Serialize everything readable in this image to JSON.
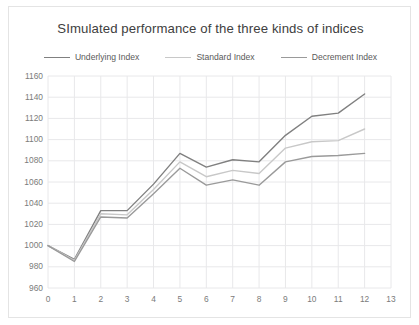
{
  "chart": {
    "title": "SImulated performance of the three kinds of indices",
    "frame_color": "#e4e4e4",
    "background": "#ffffff",
    "grid_color": "#e8e8ea",
    "axis_text_color": "#7b7b7b",
    "title_color": "#404040"
  },
  "legend": {
    "position": "top-center",
    "entries": [
      {
        "label": "Underlying Index",
        "color": "#808080"
      },
      {
        "label": "Standard Index",
        "color": "#c8c8c8"
      },
      {
        "label": "Decrement Index",
        "color": "#9a9a9a"
      }
    ]
  },
  "chart_data": {
    "type": "line",
    "title": "SImulated performance of the three kinds of indices",
    "xlabel": "",
    "ylabel": "",
    "xlim": [
      0,
      13
    ],
    "ylim": [
      960,
      1160
    ],
    "xticks": [
      0,
      1,
      2,
      3,
      4,
      5,
      6,
      7,
      8,
      9,
      10,
      11,
      12,
      13
    ],
    "yticks": [
      960,
      980,
      1000,
      1020,
      1040,
      1060,
      1080,
      1100,
      1120,
      1140,
      1160
    ],
    "grid": true,
    "x": [
      0,
      1,
      2,
      3,
      4,
      5,
      6,
      7,
      8,
      9,
      10,
      11,
      12
    ],
    "series": [
      {
        "name": "Underlying Index",
        "color": "#808080",
        "values": [
          1000,
          987,
          1033,
          1033,
          1058,
          1087,
          1074,
          1081,
          1079,
          1104,
          1122,
          1125,
          1143
        ]
      },
      {
        "name": "Standard Index",
        "color": "#c8c8c8",
        "values": [
          1000,
          986,
          1030,
          1029,
          1053,
          1079,
          1065,
          1071,
          1068,
          1092,
          1098,
          1099,
          1110
        ]
      },
      {
        "name": "Decrement Index",
        "color": "#9a9a9a",
        "values": [
          1000,
          985,
          1027,
          1026,
          1049,
          1073,
          1057,
          1062,
          1057,
          1079,
          1084,
          1085,
          1087
        ]
      }
    ]
  }
}
